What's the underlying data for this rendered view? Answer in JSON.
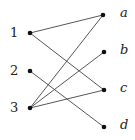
{
  "diagram": {
    "type": "bipartite-graph",
    "left_nodes": [
      {
        "id": "1",
        "label": "1",
        "x": 30,
        "y": 33
      },
      {
        "id": "2",
        "label": "2",
        "x": 30,
        "y": 71
      },
      {
        "id": "3",
        "label": "3",
        "x": 30,
        "y": 108
      }
    ],
    "right_nodes": [
      {
        "id": "a",
        "label": "a",
        "x": 103,
        "y": 15
      },
      {
        "id": "b",
        "label": "b",
        "x": 104,
        "y": 52
      },
      {
        "id": "c",
        "label": "c",
        "x": 104,
        "y": 90
      },
      {
        "id": "d",
        "label": "d",
        "x": 104,
        "y": 127
      }
    ],
    "edges": [
      {
        "from": "1",
        "to": "a"
      },
      {
        "from": "1",
        "to": "c"
      },
      {
        "from": "2",
        "to": "d"
      },
      {
        "from": "3",
        "to": "a"
      },
      {
        "from": "3",
        "to": "b"
      },
      {
        "from": "3",
        "to": "c"
      }
    ],
    "colors": {
      "edge": "#444444",
      "node": "#111111",
      "label": "#222222"
    }
  }
}
